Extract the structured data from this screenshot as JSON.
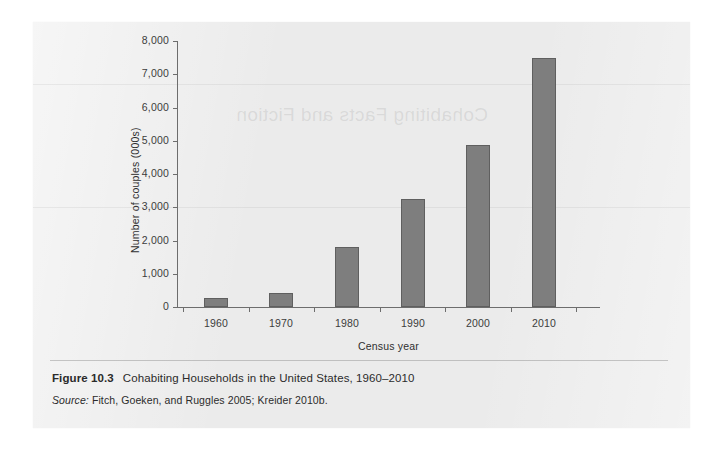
{
  "figure": {
    "number_label": "Figure 10.3",
    "title": "Cohabiting Households in the United States, 1960–2010",
    "source_label": "Source:",
    "source_text": "Fitch, Goeken, and Ruggles 2005; Kreider 2010b.",
    "ghost_text": "Cohabiting Facts and Fiction"
  },
  "colors": {
    "bar_fill": "#7e7e7e",
    "bar_border": "#5f5f5f",
    "axis": "#6d6d6d",
    "page_bg": "#ebebeb",
    "text": "#2b2b2b"
  },
  "chart_data": {
    "type": "bar",
    "title": "Cohabiting Households in the United States, 1960–2010",
    "xlabel": "Census year",
    "ylabel": "Number of couples (000s)",
    "categories": [
      "1960",
      "1970",
      "1980",
      "1990",
      "2000",
      "2010"
    ],
    "values": [
      270,
      430,
      1800,
      3250,
      4880,
      7500
    ],
    "ylim": [
      0,
      8000
    ],
    "ytick_labels": [
      "0",
      "1,000",
      "2,000",
      "3,000",
      "4,000",
      "5,000",
      "6,000",
      "7,000",
      "8,000"
    ],
    "ytick_values": [
      0,
      1000,
      2000,
      3000,
      4000,
      5000,
      6000,
      7000,
      8000
    ],
    "grid": false,
    "legend": null
  }
}
